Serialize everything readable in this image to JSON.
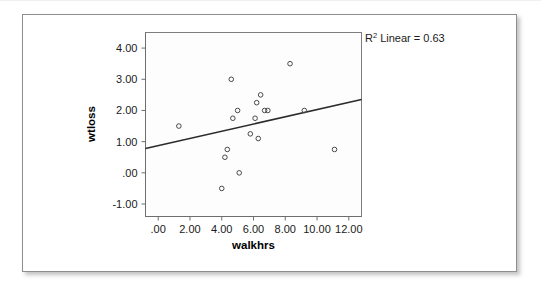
{
  "figure": {
    "annotation": {
      "prefix": "R",
      "superscript": "2",
      "text": " Linear = 0.63"
    }
  },
  "chart_data": {
    "type": "scatter",
    "title": "",
    "xlabel": "walkhrs",
    "ylabel": "wtloss",
    "xlim": [
      -0.8,
      12.8
    ],
    "ylim": [
      -1.4,
      4.5
    ],
    "xticks": [
      0,
      2,
      4,
      6,
      8,
      10,
      12
    ],
    "xtick_labels": [
      ".00",
      "2.00",
      "4.00",
      "6.00",
      "8.00",
      "10.00",
      "12.00"
    ],
    "yticks": [
      -1,
      0,
      1,
      2,
      3,
      4
    ],
    "ytick_labels": [
      "-1.00",
      ".00",
      "1.00",
      "2.00",
      "3.00",
      "4.00"
    ],
    "grid": false,
    "legend": "none",
    "r_squared": 0.63,
    "fit_type": "linear",
    "fit_line": {
      "x": [
        -0.8,
        12.8
      ],
      "y": [
        0.78,
        2.35
      ],
      "slope": 0.115,
      "intercept": 0.872
    },
    "x": [
      1.3,
      4.0,
      4.2,
      4.35,
      4.6,
      4.7,
      5.0,
      5.1,
      5.8,
      6.1,
      6.2,
      6.3,
      6.45,
      6.7,
      6.9,
      8.3,
      9.2,
      11.1
    ],
    "y": [
      1.5,
      -0.5,
      0.5,
      0.75,
      3.0,
      1.75,
      2.0,
      0.0,
      1.25,
      1.75,
      2.25,
      1.1,
      2.5,
      2.0,
      2.0,
      3.5,
      2.0,
      0.75
    ],
    "points": [
      {
        "x": 1.3,
        "y": 1.5
      },
      {
        "x": 4.0,
        "y": -0.5
      },
      {
        "x": 4.2,
        "y": 0.5
      },
      {
        "x": 4.35,
        "y": 0.75
      },
      {
        "x": 4.6,
        "y": 3.0
      },
      {
        "x": 4.7,
        "y": 1.75
      },
      {
        "x": 5.0,
        "y": 2.0
      },
      {
        "x": 5.1,
        "y": 0.0
      },
      {
        "x": 5.8,
        "y": 1.25
      },
      {
        "x": 6.1,
        "y": 1.75
      },
      {
        "x": 6.2,
        "y": 2.25
      },
      {
        "x": 6.3,
        "y": 1.1
      },
      {
        "x": 6.45,
        "y": 2.5
      },
      {
        "x": 6.7,
        "y": 2.0
      },
      {
        "x": 6.9,
        "y": 2.0
      },
      {
        "x": 8.3,
        "y": 3.5
      },
      {
        "x": 9.2,
        "y": 2.0
      },
      {
        "x": 11.1,
        "y": 0.75
      }
    ]
  },
  "colors": {
    "marker_stroke": "#4a4a4a",
    "fit_line": "#2b2b2b",
    "frame": "#7d7d7d",
    "card_border": "#8e8e8e",
    "background": "#ffffff"
  }
}
